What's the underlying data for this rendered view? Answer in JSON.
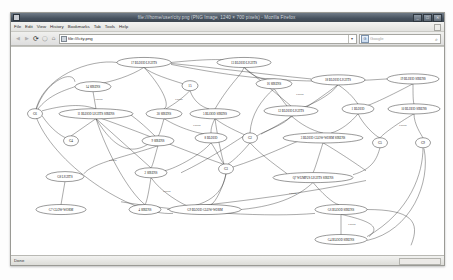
{
  "window": {
    "title": "file:///home/user/city.png (PNG Image, 1240 × 700 pixels) - Mozilla Firefox",
    "icon": "firefox-icon",
    "buttons": {
      "minimize": "_",
      "maximize": "□",
      "close": "✕"
    }
  },
  "menubar": {
    "items": [
      {
        "label": "File",
        "name": "menu-file"
      },
      {
        "label": "Edit",
        "name": "menu-edit"
      },
      {
        "label": "View",
        "name": "menu-view"
      },
      {
        "label": "History",
        "name": "menu-history"
      },
      {
        "label": "Bookmarks",
        "name": "menu-bookmarks"
      },
      {
        "label": "Tab",
        "name": "menu-tab"
      },
      {
        "label": "Tools",
        "name": "menu-tools"
      },
      {
        "label": "Help",
        "name": "menu-help"
      }
    ]
  },
  "toolbar": {
    "back_icon": "◀",
    "forward_icon": "▶",
    "reload_icon": "⟳",
    "stop_icon": "◯",
    "home_icon": "⌂",
    "url": "file:///city.png",
    "url_dropdown_icon": "▾",
    "search_engine_icon": "G",
    "search_placeholder": "Google",
    "search_go_icon": "🔍"
  },
  "statusbar": {
    "text": "Done"
  },
  "graph": {
    "title": "state-transition graph",
    "edge_label": "COPS",
    "nodes": [
      {
        "id": "n17",
        "label": "17 BLOOD LIGHTS",
        "cx": 133,
        "cy": 16,
        "rx": 27,
        "ry": 5.2
      },
      {
        "id": "n13",
        "label": "13 BLOOD LIGHTS",
        "cx": 233,
        "cy": 16,
        "rx": 27,
        "ry": 5.2
      },
      {
        "id": "n14",
        "label": "14 SIRENS",
        "cx": 82,
        "cy": 41,
        "rx": 18,
        "ry": 5.2
      },
      {
        "id": "n15",
        "label": "15",
        "cx": 179,
        "cy": 40,
        "rx": 8,
        "ry": 5.2
      },
      {
        "id": "n16",
        "label": "16 SIRENS",
        "cx": 263,
        "cy": 38,
        "rx": 18,
        "ry": 5.2
      },
      {
        "id": "n18",
        "label": "18 BLOOD LIGHTS",
        "cx": 327,
        "cy": 34,
        "rx": 27,
        "ry": 5.2
      },
      {
        "id": "n19",
        "label": "19 BLOOD SIRENS",
        "cx": 402,
        "cy": 33,
        "rx": 26,
        "ry": 5.2
      },
      {
        "id": "g6",
        "label": "G6",
        "cx": 24,
        "cy": 69,
        "rx": 7.5,
        "ry": 5.2
      },
      {
        "id": "n11",
        "label": "11 BLOOD LIGHTS SIRENS",
        "cx": 85,
        "cy": 69,
        "rx": 37,
        "ry": 5.2
      },
      {
        "id": "n20",
        "label": "20 SIRENS",
        "cx": 153,
        "cy": 69,
        "rx": 18,
        "ry": 5.2
      },
      {
        "id": "n5",
        "label": "5 BLOOD SIRENS",
        "cx": 204,
        "cy": 69,
        "rx": 25,
        "ry": 5.2
      },
      {
        "id": "n12",
        "label": "12 BLOOD LIGHTS",
        "cx": 280,
        "cy": 66,
        "rx": 27,
        "ry": 5.2
      },
      {
        "id": "n1",
        "label": "1 BLOOD",
        "cx": 347,
        "cy": 64,
        "rx": 16,
        "ry": 5.2
      },
      {
        "id": "n10",
        "label": "10 BLOOD SIRENS",
        "cx": 403,
        "cy": 64,
        "rx": 26,
        "ry": 5.2
      },
      {
        "id": "g4",
        "label": "G4",
        "cx": 60,
        "cy": 97,
        "rx": 7.5,
        "ry": 5.2
      },
      {
        "id": "n9s",
        "label": "9 SIRENS",
        "cx": 147,
        "cy": 97,
        "rx": 16,
        "ry": 5.2
      },
      {
        "id": "n8b",
        "label": "8 BLOOD",
        "cx": 200,
        "cy": 94,
        "rx": 16,
        "ry": 5.2
      },
      {
        "id": "g2",
        "label": "G2",
        "cx": 239,
        "cy": 94,
        "rx": 7.5,
        "ry": 5.2
      },
      {
        "id": "n3b",
        "label": "3 BLOOD GLOW-WORM SIRENS",
        "cx": 312,
        "cy": 94,
        "rx": 40,
        "ry": 5.2
      },
      {
        "id": "g5",
        "label": "G5",
        "cx": 369,
        "cy": 99,
        "rx": 7.5,
        "ry": 5.2
      },
      {
        "id": "g9",
        "label": "G9",
        "cx": 412,
        "cy": 99,
        "rx": 7.5,
        "ry": 5.2
      },
      {
        "id": "g8",
        "label": "G8 LIGHTS",
        "cx": 54,
        "cy": 134,
        "rx": 19,
        "ry": 5.2
      },
      {
        "id": "n2s",
        "label": "2 SIRENS",
        "cx": 140,
        "cy": 130,
        "rx": 16,
        "ry": 5.2
      },
      {
        "id": "g3",
        "label": "G3",
        "cx": 215,
        "cy": 126,
        "rx": 7.5,
        "ry": 5.2
      },
      {
        "id": "q7",
        "label": "Q7 WUMPUS LIGHTS SIRENS",
        "cx": 302,
        "cy": 135,
        "rx": 40,
        "ry": 5.2
      },
      {
        "id": "g7",
        "label": "G7 GLOW-WORM",
        "cx": 50,
        "cy": 168,
        "rx": 25,
        "ry": 5.2
      },
      {
        "id": "n4s",
        "label": "4 SIRENS",
        "cx": 134,
        "cy": 168,
        "rx": 16,
        "ry": 5.2
      },
      {
        "id": "g9b",
        "label": "G9 BLOOD GLOW-WORM",
        "cx": 194,
        "cy": 168,
        "rx": 36,
        "ry": 5.2
      },
      {
        "id": "g6b",
        "label": "G6 BLOOD SIRENS",
        "cx": 330,
        "cy": 168,
        "rx": 26,
        "ry": 5.2
      },
      {
        "id": "g4b",
        "label": "G4 BLOOD SIRENS",
        "cx": 330,
        "cy": 199,
        "rx": 26,
        "ry": 5.2
      }
    ],
    "edge_labels": [
      {
        "text": "COPS",
        "x": 88,
        "y": 55
      },
      {
        "text": "COPS",
        "x": 168,
        "y": 55
      },
      {
        "text": "COPS",
        "x": 289,
        "y": 50
      },
      {
        "text": "COPS",
        "x": 186,
        "y": 82
      },
      {
        "text": "COPS",
        "x": 392,
        "y": 82
      },
      {
        "text": "COPS",
        "x": 102,
        "y": 118
      },
      {
        "text": "COPS",
        "x": 156,
        "y": 150
      },
      {
        "text": "COPS",
        "x": 282,
        "y": 152
      },
      {
        "text": "COPS",
        "x": 341,
        "y": 184
      }
    ]
  }
}
